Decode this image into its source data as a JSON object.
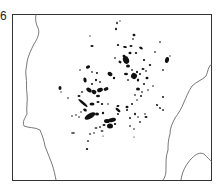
{
  "figure": {
    "label": "6",
    "caption": "",
    "colors": {
      "frame": "#333333",
      "coast": "#555555",
      "blob": "#111111",
      "background": "#ffffff"
    }
  },
  "map": {
    "description": "Scattered dark patches (clusters) inside a framed map region bounded by coastlines",
    "coastlines": [
      "left-coast",
      "right-coast",
      "bottom-right-coast"
    ],
    "cluster_count_approx": 90
  }
}
